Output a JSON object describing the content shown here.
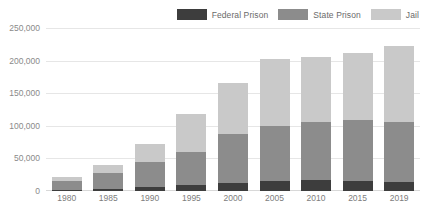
{
  "chart_data": {
    "type": "bar",
    "stacked": true,
    "title": "",
    "subtitle": "",
    "xlabel": "",
    "ylabel": "",
    "categories": [
      "1980",
      "1985",
      "1990",
      "1995",
      "2000",
      "2005",
      "2010",
      "2015",
      "2019"
    ],
    "series": [
      {
        "name": "Federal Prison",
        "color": "#3d3d3d",
        "values": [
          2000,
          3500,
          6000,
          9000,
          12000,
          15500,
          17000,
          15000,
          14000
        ]
      },
      {
        "name": "State Prison",
        "color": "#8c8c8c",
        "values": [
          13000,
          24000,
          39000,
          51000,
          75000,
          85000,
          89000,
          94000,
          92000
        ]
      },
      {
        "name": "Jail",
        "color": "#c9c9c9",
        "values": [
          6000,
          13000,
          27000,
          58000,
          78000,
          102000,
          99000,
          102000,
          116000
        ]
      }
    ],
    "totals": [
      21000,
      40500,
      72000,
      118000,
      165000,
      202500,
      205000,
      211000,
      222000
    ],
    "ylim": [
      0,
      250000
    ],
    "yticks": [
      "0",
      "50,000",
      "100,000",
      "150,000",
      "200,000",
      "250,000"
    ],
    "ytick_values": [
      0,
      50000,
      100000,
      150000,
      200000,
      250000
    ],
    "grid": true,
    "legend_position": "top-right",
    "legend": [
      {
        "label": "Federal Prison",
        "color": "#3d3d3d"
      },
      {
        "label": "State Prison",
        "color": "#8c8c8c"
      },
      {
        "label": "Jail",
        "color": "#c9c9c9"
      }
    ]
  }
}
